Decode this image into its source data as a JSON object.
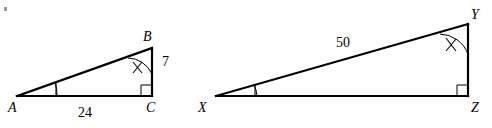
{
  "figure": {
    "kind": "geometry-diagram",
    "background_color": "#ffffff",
    "ink_color": "#000000",
    "triangles": [
      {
        "id": "left",
        "name": "triangle-abc",
        "vertices": [
          {
            "name": "A",
            "label": "A",
            "label_x": 12,
            "label_y": 110,
            "x": 17,
            "y": 96
          },
          {
            "name": "B",
            "label": "B",
            "label_x": 145,
            "label_y": 40,
            "x": 152,
            "y": 48
          },
          {
            "name": "C",
            "label": "C",
            "label_x": 147,
            "label_y": 111,
            "x": 152,
            "y": 96
          }
        ],
        "side_labels": [
          {
            "name": "side-ac-length",
            "text": "24",
            "x": 77,
            "y": 116
          },
          {
            "name": "side-bc-length",
            "text": "7",
            "x": 159,
            "y": 64
          }
        ],
        "angle_marks": [
          {
            "name": "angle-a-mark",
            "vertex": "A",
            "ticks": 1
          },
          {
            "name": "angle-b-mark",
            "vertex": "B",
            "ticks": 2
          },
          {
            "name": "angle-c-right-angle",
            "vertex": "C",
            "ticks": 0,
            "right_angle": true
          }
        ]
      },
      {
        "id": "right",
        "name": "triangle-xyz",
        "vertices": [
          {
            "name": "X",
            "label": "X",
            "label_x": 198,
            "label_y": 111,
            "x": 216,
            "y": 96
          },
          {
            "name": "Y",
            "label": "Y",
            "label_x": 472,
            "label_y": 18,
            "x": 468,
            "y": 24
          },
          {
            "name": "Z",
            "label": "Z",
            "label_x": 472,
            "label_y": 111,
            "x": 468,
            "y": 96
          }
        ],
        "side_labels": [
          {
            "name": "side-xy-length",
            "text": "50",
            "x": 334,
            "y": 47
          }
        ],
        "angle_marks": [
          {
            "name": "angle-x-mark",
            "vertex": "X",
            "ticks": 1
          },
          {
            "name": "angle-y-mark",
            "vertex": "Y",
            "ticks": 2
          },
          {
            "name": "angle-z-right-angle",
            "vertex": "Z",
            "ticks": 0,
            "right_angle": true
          }
        ]
      }
    ]
  },
  "labels": {
    "a": "A",
    "b": "B",
    "c": "C",
    "x": "X",
    "y": "Y",
    "z": "Z",
    "len_ac": "24",
    "len_bc": "7",
    "len_xy": "50"
  }
}
